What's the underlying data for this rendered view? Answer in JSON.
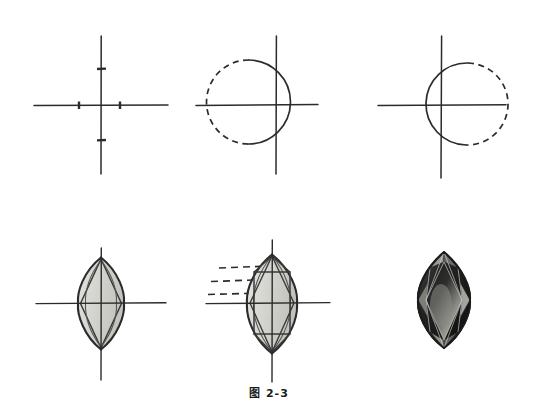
{
  "figure": {
    "caption": "图 2-3",
    "caption_number": "2-3",
    "title_prefix": "图",
    "page_width": 538,
    "page_height": 419,
    "background_color": "#ffffff",
    "ink_color": "#2b2b2b",
    "step_count": 6
  },
  "panels": [
    {
      "id": "step-1",
      "label": "step-1-axes-with-ticks",
      "description": "crossed construction axes with four measurement tick marks",
      "center": {
        "x": 101,
        "y": 105
      },
      "axis_horizontal": {
        "x1": 34,
        "x2": 168,
        "y": 105
      },
      "axis_vertical": {
        "y1": 36,
        "y2": 174,
        "x": 101
      },
      "ticks": [
        {
          "name": "tick-left",
          "axis": "horizontal",
          "x": 79,
          "y": 105
        },
        {
          "name": "tick-right",
          "axis": "horizontal",
          "x": 120,
          "y": 105
        },
        {
          "name": "tick-top",
          "axis": "vertical",
          "x": 101,
          "y": 69
        },
        {
          "name": "tick-bottom",
          "axis": "vertical",
          "x": 101,
          "y": 140
        }
      ]
    },
    {
      "id": "step-2",
      "label": "step-2-circle-right-arc-solid",
      "description": "circle on the axes: right arc drawn solid, left arc dashed",
      "center": {
        "x": 276,
        "y": 105
      },
      "circle": {
        "cx": 248,
        "cy": 102,
        "r": 42
      },
      "solid_arc": "right half",
      "dashed_arc": "left half",
      "axis_horizontal": {
        "x1": 196,
        "x2": 318,
        "y": 105
      },
      "axis_vertical": {
        "y1": 36,
        "y2": 174,
        "x": 276
      }
    },
    {
      "id": "step-3",
      "label": "step-3-circle-left-arc-solid",
      "description": "mirrored circle: left arc drawn solid, right arc dashed",
      "center": {
        "x": 441,
        "y": 105
      },
      "circle": {
        "cx": 466,
        "cy": 104,
        "r": 41
      },
      "solid_arc": "left half",
      "dashed_arc": "right half",
      "axis_horizontal": {
        "x1": 378,
        "x2": 506,
        "y": 105
      },
      "axis_vertical": {
        "y1": 36,
        "y2": 178,
        "x": 441
      }
    },
    {
      "id": "step-4",
      "label": "step-4-marquise-outline-with-rhombus",
      "description": "vesica / marquise outline formed by the two arcs, inner rhombus facet lines, light grey fill",
      "center": {
        "x": 101,
        "y": 303
      },
      "lens": {
        "half_width": 22,
        "half_height": 45
      },
      "axis_horizontal": {
        "x1": 36,
        "x2": 166,
        "y": 303
      },
      "axis_vertical": {
        "y1": 248,
        "y2": 380,
        "x": 101
      },
      "fill_color": "#d6d6d2",
      "has_rhombus": true
    },
    {
      "id": "step-5",
      "label": "step-5-marquise-with-table-facets",
      "description": "marquise with rectangular table facet, girdle facets and three dashed horizontal guide lines at the left",
      "center": {
        "x": 272,
        "y": 303
      },
      "lens": {
        "half_width": 24,
        "half_height": 48
      },
      "axis_horizontal": {
        "x1": 206,
        "x2": 330,
        "y": 303
      },
      "axis_vertical": {
        "y1": 240,
        "y2": 382,
        "x": 272
      },
      "fill_color": "#d6d6d2",
      "guide_lines": [
        {
          "name": "guide-line-1",
          "x1": 219,
          "x2": 270,
          "y": 268
        },
        {
          "name": "guide-line-2",
          "x1": 211,
          "x2": 268,
          "y": 281
        },
        {
          "name": "guide-line-3",
          "x1": 208,
          "x2": 262,
          "y": 294
        }
      ],
      "has_table_facet": true
    },
    {
      "id": "step-6",
      "label": "step-6-finished-marquise-gem",
      "description": "finished shaded marquise gemstone rendering, dark tone with highlights, no construction axes",
      "center": {
        "x": 444,
        "y": 300
      },
      "lens": {
        "half_width": 27,
        "half_height": 48
      },
      "fill_color": "#2a2a2a",
      "highlight_color": "#b9b9b4",
      "shadow_color": "#111111",
      "has_axes": false
    }
  ],
  "icons": {
    "tick_mark": "tick-mark-icon",
    "dashed_guide": "dashed-guide-icon"
  }
}
